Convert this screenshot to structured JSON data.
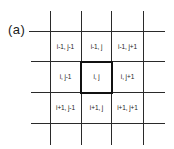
{
  "figure": {
    "label": "(a)",
    "grid": {
      "rows": [
        [
          "i-1, j-1",
          "i-1, j",
          "i-1, j+1"
        ],
        [
          "i, j-1",
          "i, j",
          "i, j+1"
        ],
        [
          "i+1, j-1",
          "i+1, j",
          "i+1, j+1"
        ]
      ],
      "highlighted_cell": "i, j"
    },
    "colors": {
      "line": "#2a2a2a",
      "highlight_border": "#111111",
      "background": "#ffffff"
    }
  }
}
